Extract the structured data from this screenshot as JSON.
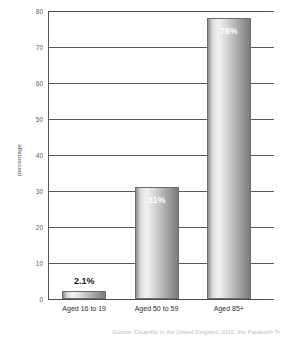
{
  "chart_data": {
    "type": "bar",
    "title": "",
    "subtitle": "",
    "xlabel": "",
    "ylabel": "percentage",
    "categories": [
      "Aged 16 to 19",
      "Aged 50 to 59",
      "Aged 85+"
    ],
    "values": [
      2.1,
      31,
      78
    ],
    "data_labels": [
      "2.1%",
      "31%",
      "78%"
    ],
    "ylim": [
      0,
      80
    ],
    "yticks": [
      0,
      10,
      20,
      30,
      40,
      50,
      60,
      70,
      80
    ],
    "ytick_labels": [
      "0",
      "10",
      "20",
      "30",
      "40",
      "50",
      "60",
      "70",
      "80"
    ],
    "grid": "horizontal",
    "legend": "none",
    "bar_fill": "grey-horizontal-gradient",
    "bar_border_color": "#6e6e6e",
    "gridline_color": "#5a5a5a",
    "label_color_inside": "#ffffff",
    "label_color_outside": "#1a1a1a"
  },
  "notes": {
    "source": "Source: Disability in the United Kingdom 2010, the Papworth Tr"
  }
}
